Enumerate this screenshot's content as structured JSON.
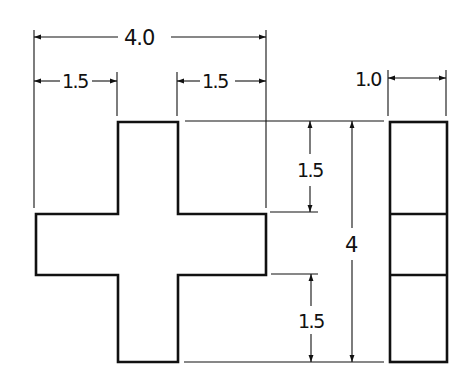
{
  "drawing": {
    "title": "Cross-shaped part orthographic views",
    "colors": {
      "line": "#111111",
      "background": "#ffffff"
    },
    "front_view": {
      "shape": "cross",
      "outline_points": "36,214 118,214 118,122 178,122 178,214 266,214 266,275 178,275 178,362 118,362 118,275 36,275"
    },
    "side_view": {
      "shape": "rectangle-segmented",
      "x": 390,
      "y": 122,
      "width": 57,
      "height": 240,
      "dividers_y": [
        214,
        275
      ]
    },
    "dimensions": {
      "overall_width": {
        "label": "4.0",
        "value": 4.0
      },
      "left_arm_width": {
        "label": "1.5",
        "value": 1.5
      },
      "right_arm_width": {
        "label": "1.5",
        "value": 1.5
      },
      "side_thickness": {
        "label": "1.0",
        "value": 1.0
      },
      "top_arm_height": {
        "label": "1.5",
        "value": 1.5
      },
      "bottom_arm_height": {
        "label": "1.5",
        "value": 1.5
      },
      "overall_height": {
        "label": "4",
        "value": 4
      }
    }
  }
}
